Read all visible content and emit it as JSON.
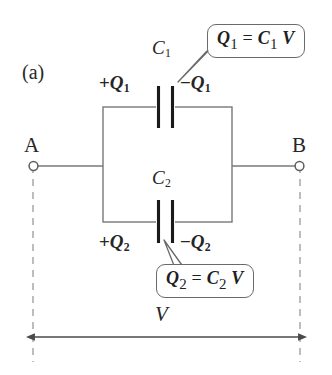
{
  "figure": {
    "panel_label": "(a)",
    "caption_terms": {
      "voltage_label": "V"
    }
  },
  "circuit": {
    "terminals": [
      {
        "name": "A",
        "label": "A",
        "position": "left"
      },
      {
        "name": "B",
        "label": "B",
        "position": "right"
      }
    ],
    "capacitors": [
      {
        "id": "C1",
        "label": "C",
        "subscript": "1",
        "branch": "top",
        "plate_charges": {
          "positive": {
            "sign": "+",
            "symbol": "Q",
            "subscript": "1"
          },
          "negative": {
            "sign": "−",
            "symbol": "Q",
            "subscript": "1"
          }
        }
      },
      {
        "id": "C2",
        "label": "C",
        "subscript": "2",
        "branch": "bottom",
        "plate_charges": {
          "positive": {
            "sign": "+",
            "symbol": "Q",
            "subscript": "2"
          },
          "negative": {
            "sign": "−",
            "symbol": "Q",
            "subscript": "2"
          }
        }
      }
    ],
    "voltage_span": {
      "label": "V",
      "style": "double-headed-arrow"
    }
  },
  "callouts": [
    {
      "id": "q1-equation",
      "lhs_symbol": "Q",
      "lhs_sub": "1",
      "operator": "=",
      "rhs_symbol": "C",
      "rhs_sub": "1",
      "rhs_factor": "V",
      "plain_text": "Q1 = C1 V",
      "points_to": "C1-negative-plate"
    },
    {
      "id": "q2-equation",
      "lhs_symbol": "Q",
      "lhs_sub": "2",
      "operator": "=",
      "rhs_symbol": "C",
      "rhs_sub": "2",
      "rhs_factor": "V",
      "plain_text": "Q2 = C2 V",
      "points_to": "C2-negative-plate"
    }
  ],
  "colors": {
    "background": "#ffffff",
    "wire": "#6f6f6f",
    "plate": "#1a1a1a",
    "text": "#262626",
    "callout_border": "#6a6a6a",
    "dashed_guide": "#9a9a9a"
  }
}
